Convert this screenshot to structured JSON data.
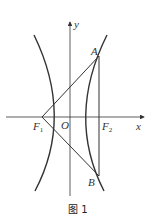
{
  "figure": {
    "caption": "图 1",
    "axes": {
      "x_label": "x",
      "y_label": "y"
    },
    "points": {
      "A": "A",
      "B": "B",
      "O": "O",
      "F1": "F",
      "F1_sub": "1",
      "F2": "F",
      "F2_sub": "2"
    }
  }
}
